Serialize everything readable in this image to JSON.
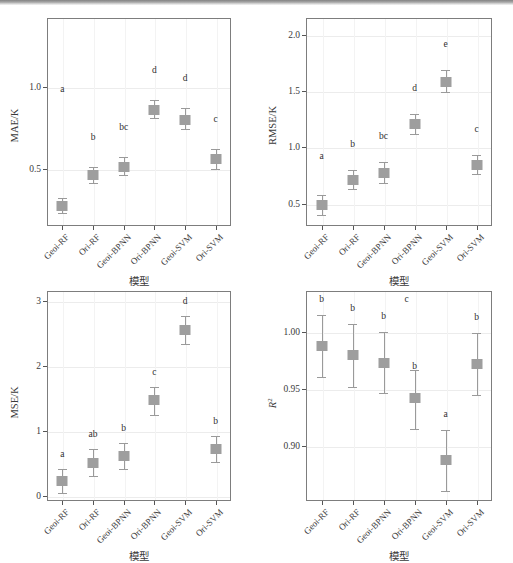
{
  "figure": {
    "x_axis_title": "模型",
    "categories": [
      "Geoi-RF",
      "Ori-RF",
      "Geoi-BPNN",
      "Ori-BPNN",
      "Geoi-SVM",
      "Ori-SVM"
    ],
    "marker_color": "#9e9e9e",
    "errorbar_color": "#9a9a9e",
    "axis_color": "#7d7d7d"
  },
  "chart_data": [
    {
      "type": "scatter",
      "panel": "top-left",
      "title": "",
      "xlabel": "模型",
      "ylabel": "MAE/K",
      "categories": [
        "Geoi-RF",
        "Ori-RF",
        "Geoi-BPNN",
        "Ori-BPNN",
        "Geoi-SVM",
        "Ori-SVM"
      ],
      "values": [
        0.27,
        0.46,
        0.51,
        0.86,
        0.8,
        0.56
      ],
      "err_low": [
        0.23,
        0.41,
        0.46,
        0.81,
        0.74,
        0.5
      ],
      "err_high": [
        0.32,
        0.51,
        0.57,
        0.92,
        0.87,
        0.62
      ],
      "sig_letters": [
        "a",
        "b",
        "bc",
        "d",
        "d",
        "c"
      ],
      "yticks": [
        0.5,
        1.0
      ],
      "ytick_labels": [
        "0.5",
        "1.0"
      ],
      "ylim": [
        0.15,
        1.42
      ],
      "grid": true,
      "legend": "none"
    },
    {
      "type": "scatter",
      "panel": "top-right",
      "title": "",
      "xlabel": "模型",
      "ylabel": "RMSE/K",
      "categories": [
        "Geoi-RF",
        "Ori-RF",
        "Geoi-BPNN",
        "Ori-BPNN",
        "Geoi-SVM",
        "Ori-SVM"
      ],
      "values": [
        0.49,
        0.71,
        0.77,
        1.21,
        1.58,
        0.84
      ],
      "err_low": [
        0.4,
        0.63,
        0.68,
        1.12,
        1.49,
        0.76
      ],
      "err_high": [
        0.58,
        0.8,
        0.87,
        1.3,
        1.69,
        0.93
      ],
      "sig_letters": [
        "a",
        "b",
        "bc",
        "d",
        "e",
        "c"
      ],
      "yticks": [
        0.5,
        1.0,
        1.5,
        2.0
      ],
      "ytick_labels": [
        "0.5",
        "1.0",
        "1.5",
        "2.0"
      ],
      "ylim": [
        0.3,
        2.15
      ],
      "grid": true,
      "legend": "none"
    },
    {
      "type": "scatter",
      "panel": "bottom-left",
      "title": "",
      "xlabel": "模型",
      "ylabel": "MSE/K",
      "categories": [
        "Geoi-RF",
        "Ori-RF",
        "Geoi-BPNN",
        "Ori-BPNN",
        "Geoi-SVM",
        "Ori-SVM"
      ],
      "values": [
        0.23,
        0.51,
        0.61,
        1.47,
        2.55,
        0.72
      ],
      "err_low": [
        0.04,
        0.3,
        0.41,
        1.25,
        2.33,
        0.52
      ],
      "err_high": [
        0.41,
        0.72,
        0.81,
        1.68,
        2.77,
        0.92
      ],
      "sig_letters": [
        "a",
        "ab",
        "b",
        "c",
        "d",
        "b"
      ],
      "yticks": [
        0,
        1,
        2,
        3
      ],
      "ytick_labels": [
        "0",
        "1",
        "2",
        "3"
      ],
      "ylim": [
        -0.08,
        3.15
      ],
      "grid": true,
      "legend": "none"
    },
    {
      "type": "scatter",
      "panel": "bottom-right",
      "title": "",
      "xlabel": "模型",
      "ylabel": "R²",
      "categories": [
        "Geoi-RF",
        "Ori-RF",
        "Geoi-BPNN",
        "Ori-BPNN",
        "Geoi-SVM",
        "Ori-SVM"
      ],
      "values": [
        0.988,
        0.98,
        0.973,
        0.942,
        0.888,
        0.972
      ],
      "err_low": [
        0.961,
        0.952,
        0.947,
        0.915,
        0.861,
        0.945
      ],
      "err_high": [
        1.015,
        1.007,
        1.0,
        0.967,
        0.914,
        0.999
      ],
      "sig_letters": [
        "b",
        "b",
        "b",
        "b",
        "a",
        "b"
      ],
      "extra_letters": [
        {
          "label": "c",
          "category_index": 3
        }
      ],
      "yticks": [
        0.9,
        0.95,
        1.0
      ],
      "ytick_labels": [
        "0.90",
        "0.95",
        "1.00"
      ],
      "ylim": [
        0.852,
        1.036
      ],
      "grid": true,
      "legend": "none"
    }
  ]
}
